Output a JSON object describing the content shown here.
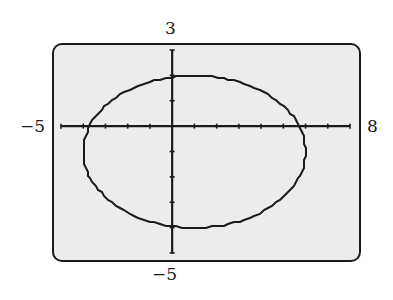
{
  "window": {
    "xmin_label": "−5",
    "xmax_label": "8",
    "ymax_label": "3",
    "ymin_label": "−5"
  },
  "colors": {
    "screen_bg": "#ececec",
    "ink": "#1a1a1a"
  },
  "chart_data": {
    "type": "line",
    "title": "",
    "xlabel": "",
    "ylabel": "",
    "xlim": [
      -5,
      8
    ],
    "ylim": [
      -5,
      3
    ],
    "xscale": 1,
    "yscale": 1,
    "grid": false,
    "curve": "ellipse",
    "equation": "(x-1)^2/25 + (y+1)^2/9 = 1",
    "center": [
      1,
      -1
    ],
    "semi_axis_x": 5,
    "semi_axis_y": 3,
    "vertices": [
      [
        -4,
        -1
      ],
      [
        6,
        -1
      ],
      [
        1,
        2
      ],
      [
        1,
        -4
      ]
    ],
    "tick_labels": {
      "left": "−5",
      "right": "8",
      "top": "3",
      "bottom": "−5"
    }
  }
}
